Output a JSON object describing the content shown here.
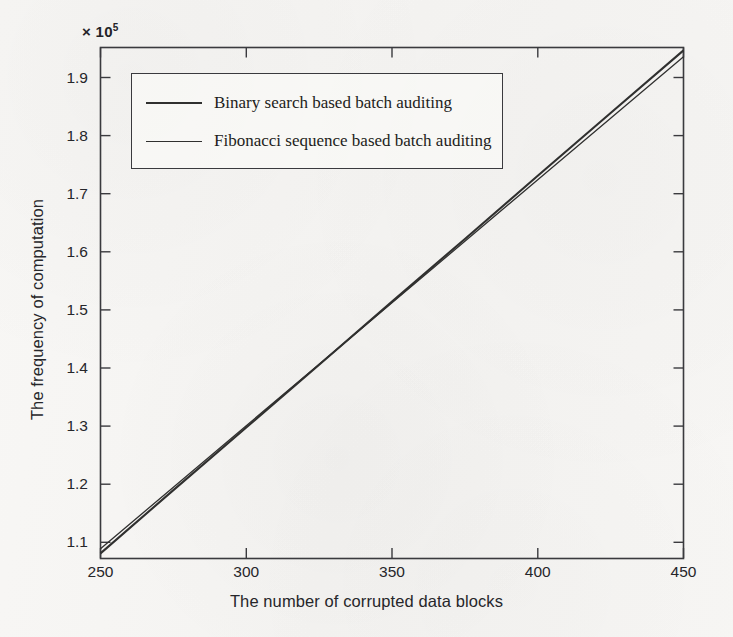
{
  "figure": {
    "background_color": "#f6f5f3",
    "axis_color": "#3a3a3e",
    "exponent_label": "× 10",
    "exponent_power": "5"
  },
  "chart_data": {
    "type": "line",
    "title": "",
    "xlabel": "The number of corrupted data blocks",
    "ylabel": "The frequency of computation",
    "y_axis_exponent": 100000,
    "y_exponent_text": "× 10⁵",
    "xlim": [
      250,
      450
    ],
    "ylim": [
      109000,
      197000
    ],
    "xticks": [
      250,
      300,
      350,
      400,
      450
    ],
    "xtick_labels": [
      "250",
      "300",
      "350",
      "400",
      "450"
    ],
    "yticks": [
      110000,
      120000,
      130000,
      140000,
      150000,
      160000,
      170000,
      180000,
      190000
    ],
    "ytick_labels": [
      "1.1",
      "1.2",
      "1.3",
      "1.4",
      "1.5",
      "1.6",
      "1.7",
      "1.8",
      "1.9"
    ],
    "grid": false,
    "legend_position": "upper left",
    "x": [
      250,
      275,
      300,
      325,
      350,
      375,
      400,
      425,
      450
    ],
    "series": [
      {
        "name": "Binary search based batch auditing",
        "color": "#30302f",
        "line_width": 2.1,
        "values": [
          109800,
          120700,
          131500,
          142300,
          153200,
          164000,
          174900,
          185700,
          196500
        ]
      },
      {
        "name": "Fibonacci sequence based batch auditing",
        "color": "#30302f",
        "line_width": 1.3,
        "values": [
          110600,
          121200,
          131800,
          142400,
          153000,
          163600,
          174200,
          184800,
          195400
        ]
      }
    ]
  },
  "legend": {
    "items": [
      {
        "label": "Binary search based batch auditing"
      },
      {
        "label": "Fibonacci sequence based batch auditing"
      }
    ]
  }
}
